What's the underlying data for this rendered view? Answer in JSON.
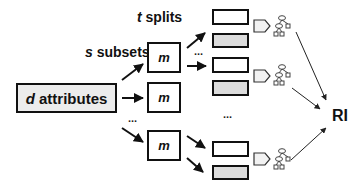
{
  "diagram": {
    "labels": {
      "t_var": "t",
      "splits": " splits",
      "s_var": "s",
      "subsets": " subsets",
      "d_var": "d",
      "attributes": " attributes",
      "result": "RI",
      "ellipsis": "..."
    },
    "model_boxes": [
      {
        "label": "m"
      },
      {
        "label": "m"
      },
      {
        "label": "m"
      }
    ],
    "split_pairs": 3,
    "tree_icons": 3,
    "colors": {
      "stroke": "#111111",
      "attr_fill": "#ececec",
      "split_gray": "#dcdcdc",
      "tree_stroke": "#444444"
    }
  }
}
